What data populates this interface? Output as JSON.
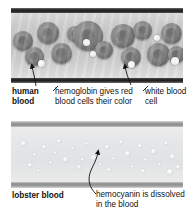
{
  "figure": {
    "panels": [
      {
        "id": "human-vessel",
        "name": "human blood vessel cross-section",
        "label": "human blood"
      },
      {
        "id": "lobster-vessel",
        "name": "lobster blood vessel cross-section",
        "label": "lobster blood"
      }
    ]
  },
  "labels": {
    "human_blood": "human blood",
    "hemoglobin": "hemoglobin gives red blood cells their color",
    "white_blood_cell": "white blood cell",
    "lobster_blood": "lobster blood",
    "hemocyanin": "hemocyanin is dissolved in the blood"
  },
  "colors": {
    "text": "#121212",
    "vessel_wall_human": "#1e1e1e",
    "vessel_wall_lobster": "#9a9a9a",
    "plasma_human": "#cfcfcf",
    "plasma_lobster": "#e4e6e7",
    "red_blood_cell": "#8b8b8b",
    "white_blood_cell": "#ffffff",
    "background": "#ffffff"
  },
  "cells": {
    "red_blood_cells": [
      {
        "x": 2,
        "y": 18,
        "d": 20
      },
      {
        "x": 14,
        "y": 34,
        "d": 19
      },
      {
        "x": 26,
        "y": 9,
        "d": 22
      },
      {
        "x": 40,
        "y": 30,
        "d": 21
      },
      {
        "x": 56,
        "y": 13,
        "d": 16
      },
      {
        "x": 62,
        "y": 8,
        "d": 30
      },
      {
        "x": 84,
        "y": 28,
        "d": 18
      },
      {
        "x": 100,
        "y": 11,
        "d": 24
      },
      {
        "x": 110,
        "y": 34,
        "d": 20
      },
      {
        "x": 122,
        "y": 8,
        "d": 19
      },
      {
        "x": 136,
        "y": 30,
        "d": 23
      },
      {
        "x": 150,
        "y": 10,
        "d": 21
      },
      {
        "x": 157,
        "y": 33,
        "d": 17
      }
    ],
    "white_blood_cells": [
      {
        "x": 27,
        "y": 47,
        "d": 7
      },
      {
        "x": 72,
        "y": 26,
        "d": 7
      },
      {
        "x": 79,
        "y": 38,
        "d": 6
      },
      {
        "x": 117,
        "y": 48,
        "d": 7
      },
      {
        "x": 143,
        "y": 22,
        "d": 6
      },
      {
        "x": 160,
        "y": 44,
        "d": 8
      }
    ],
    "hemocyanin_specks": [
      {
        "x": 10,
        "y": 14,
        "d": 5
      },
      {
        "x": 22,
        "y": 26,
        "d": 3
      },
      {
        "x": 31,
        "y": 18,
        "d": 4
      },
      {
        "x": 38,
        "y": 34,
        "d": 3
      },
      {
        "x": 46,
        "y": 12,
        "d": 4
      },
      {
        "x": 52,
        "y": 30,
        "d": 5
      },
      {
        "x": 60,
        "y": 20,
        "d": 3
      },
      {
        "x": 66,
        "y": 38,
        "d": 4
      },
      {
        "x": 74,
        "y": 15,
        "d": 3
      },
      {
        "x": 80,
        "y": 28,
        "d": 5
      },
      {
        "x": 88,
        "y": 36,
        "d": 3
      },
      {
        "x": 94,
        "y": 18,
        "d": 4
      },
      {
        "x": 101,
        "y": 30,
        "d": 3
      },
      {
        "x": 108,
        "y": 13,
        "d": 4
      },
      {
        "x": 114,
        "y": 24,
        "d": 5
      },
      {
        "x": 120,
        "y": 38,
        "d": 3
      },
      {
        "x": 127,
        "y": 17,
        "d": 4
      },
      {
        "x": 133,
        "y": 31,
        "d": 3
      },
      {
        "x": 140,
        "y": 22,
        "d": 5
      },
      {
        "x": 147,
        "y": 36,
        "d": 3
      },
      {
        "x": 153,
        "y": 14,
        "d": 4
      },
      {
        "x": 159,
        "y": 27,
        "d": 5
      },
      {
        "x": 165,
        "y": 38,
        "d": 4
      },
      {
        "x": 17,
        "y": 36,
        "d": 4
      },
      {
        "x": 26,
        "y": 42,
        "d": 3
      },
      {
        "x": 43,
        "y": 24,
        "d": 3
      },
      {
        "x": 70,
        "y": 31,
        "d": 3
      },
      {
        "x": 96,
        "y": 41,
        "d": 4
      },
      {
        "x": 130,
        "y": 42,
        "d": 4
      },
      {
        "x": 156,
        "y": 42,
        "d": 6
      }
    ]
  }
}
